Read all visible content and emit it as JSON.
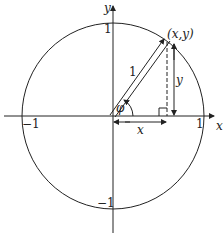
{
  "diagram": {
    "axes": {
      "x_label": "x",
      "y_label": "y"
    },
    "ticks": {
      "x_pos": "1",
      "x_neg": "−1",
      "y_pos": "1",
      "y_neg": "−1"
    },
    "point_label": "(x,y)",
    "radius_label": "1",
    "angle_label": "φ",
    "x_segment_label": "x",
    "y_segment_label": "y",
    "colors": {
      "stroke": "#222222",
      "background": "#ffffff"
    }
  }
}
